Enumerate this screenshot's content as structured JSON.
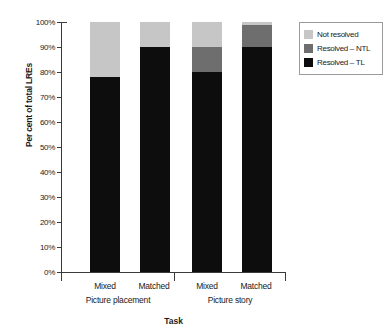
{
  "chart_data": {
    "type": "bar",
    "subtype": "stacked-percentage",
    "title": "",
    "xlabel": "Task",
    "ylabel": "Per cent of total LREs",
    "ylim": [
      0,
      100
    ],
    "yticks": [
      "0%",
      "10%",
      "20%",
      "30%",
      "40%",
      "50%",
      "60%",
      "70%",
      "80%",
      "90%",
      "100%"
    ],
    "ytick_values": [
      0,
      10,
      20,
      30,
      40,
      50,
      60,
      70,
      80,
      90,
      100
    ],
    "grid": false,
    "legend_position": "top-right-outside",
    "categories": [
      "Mixed",
      "Matched",
      "Mixed",
      "Matched"
    ],
    "groups": [
      {
        "label": "Picture placement",
        "categories": [
          "Mixed",
          "Matched"
        ]
      },
      {
        "label": "Picture story",
        "categories": [
          "Mixed",
          "Matched"
        ]
      }
    ],
    "series": [
      {
        "name": "Resolved – TL",
        "color": "#0d0d0d",
        "values": [
          78,
          90,
          80,
          90
        ]
      },
      {
        "name": "Resolved – NTL",
        "color": "#6e6e6e",
        "values": [
          0,
          0,
          10,
          9
        ]
      },
      {
        "name": "Not resolved",
        "color": "#c6c6c6",
        "values": [
          22,
          10,
          10,
          1
        ]
      }
    ],
    "bars": [
      {
        "group": "Picture placement",
        "category": "Mixed",
        "not_resolved": 22,
        "resolved_ntl": 0,
        "resolved_tl": 78
      },
      {
        "group": "Picture placement",
        "category": "Matched",
        "not_resolved": 10,
        "resolved_ntl": 0,
        "resolved_tl": 90
      },
      {
        "group": "Picture story",
        "category": "Mixed",
        "not_resolved": 10,
        "resolved_ntl": 10,
        "resolved_tl": 80
      },
      {
        "group": "Picture story",
        "category": "Matched",
        "not_resolved": 1,
        "resolved_ntl": 9,
        "resolved_tl": 90
      }
    ]
  },
  "axes": {
    "ylabel": "Per cent of total LREs",
    "xlabel": "Task",
    "yticks": [
      {
        "label": "100%"
      },
      {
        "label": "90%"
      },
      {
        "label": "80%"
      },
      {
        "label": "70%"
      },
      {
        "label": "60%"
      },
      {
        "label": "50%"
      },
      {
        "label": "40%"
      },
      {
        "label": "30%"
      },
      {
        "label": "20%"
      },
      {
        "label": "10%"
      },
      {
        "label": "0%"
      }
    ],
    "categories": [
      {
        "label": "Mixed"
      },
      {
        "label": "Matched"
      },
      {
        "label": "Mixed"
      },
      {
        "label": "Matched"
      }
    ],
    "groups": [
      {
        "label": "Picture placement"
      },
      {
        "label": "Picture story"
      }
    ]
  },
  "legend": {
    "items": [
      {
        "label": "Not resolved",
        "color": "#c6c6c6",
        "swatch": "legend-swatch-light"
      },
      {
        "label": "Resolved – NTL",
        "color": "#6e6e6e",
        "swatch": "legend-swatch-medium"
      },
      {
        "label": "Resolved – TL",
        "color": "#0d0d0d",
        "swatch": "legend-swatch-dark"
      }
    ]
  },
  "colors": {
    "not_resolved": "#c6c6c6",
    "resolved_ntl": "#6e6e6e",
    "resolved_tl": "#0d0d0d",
    "axis": "#3a3a3a",
    "legend_border": "#9a9a9a",
    "background": "#ffffff"
  }
}
